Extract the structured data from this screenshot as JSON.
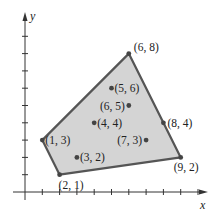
{
  "chart_data": {
    "type": "scatter",
    "title": "",
    "xlabel": "x",
    "ylabel": "y",
    "xlim": [
      0,
      10
    ],
    "ylim": [
      0,
      9
    ],
    "grid": false,
    "x_ticks": [
      1,
      2,
      3,
      4,
      5,
      6,
      7,
      8,
      9,
      10
    ],
    "y_ticks": [
      1,
      2,
      3,
      4,
      5,
      6,
      7,
      8,
      9
    ],
    "hull_polygon": [
      [
        1,
        3
      ],
      [
        6,
        8
      ],
      [
        8,
        4
      ],
      [
        9,
        2
      ],
      [
        2,
        1
      ]
    ],
    "points": [
      {
        "x": 6,
        "y": 8,
        "label": "(6, 8)",
        "vertex": true
      },
      {
        "x": 5,
        "y": 6,
        "label": "(5, 6)",
        "vertex": false
      },
      {
        "x": 6,
        "y": 5,
        "label": "(6, 5)",
        "vertex": false
      },
      {
        "x": 4,
        "y": 4,
        "label": "(4, 4)",
        "vertex": false
      },
      {
        "x": 8,
        "y": 4,
        "label": "(8, 4)",
        "vertex": true
      },
      {
        "x": 1,
        "y": 3,
        "label": "(1, 3)",
        "vertex": true
      },
      {
        "x": 7,
        "y": 3,
        "label": "(7, 3)",
        "vertex": false
      },
      {
        "x": 3,
        "y": 2,
        "label": "(3, 2)",
        "vertex": false
      },
      {
        "x": 9,
        "y": 2,
        "label": "(9, 2)",
        "vertex": true
      },
      {
        "x": 2,
        "y": 1,
        "label": "(2, 1)",
        "vertex": true
      }
    ],
    "colors": {
      "fill": "#d4d4d4",
      "edge": "#555555",
      "point": "#444444"
    }
  },
  "axes": {
    "x_label": "x",
    "y_label": "y"
  }
}
